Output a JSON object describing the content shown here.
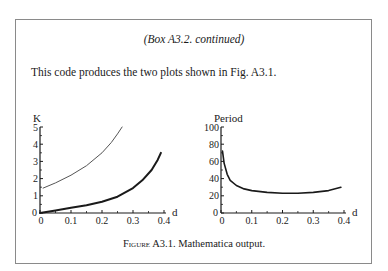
{
  "box": {
    "title": "(Box A3.2. continued)",
    "intro": "This code produces the two plots shown in Fig. A3.1."
  },
  "caption": {
    "label": "Figure A3.1.",
    "text": "Mathematica output."
  },
  "chart_data": [
    {
      "type": "line",
      "title": "",
      "ylabel": "K",
      "xlabel": "d",
      "xlim": [
        0,
        0.4
      ],
      "ylim": [
        0,
        5
      ],
      "xticks": [
        "0",
        "0.1",
        "0.2",
        "0.3",
        "0.4"
      ],
      "yticks": [
        "0",
        "1",
        "2",
        "3",
        "4",
        "5"
      ],
      "grid": false,
      "series": [
        {
          "name": "upper curve (thin)",
          "x": [
            0.01,
            0.05,
            0.1,
            0.15,
            0.2,
            0.23,
            0.25,
            0.265
          ],
          "y": [
            1.45,
            1.75,
            2.2,
            2.75,
            3.5,
            4.1,
            4.6,
            5.0
          ]
        },
        {
          "name": "lower curve (thick)",
          "x": [
            0.0,
            0.05,
            0.1,
            0.15,
            0.2,
            0.25,
            0.3,
            0.33,
            0.36,
            0.38,
            0.39
          ],
          "y": [
            0.0,
            0.15,
            0.3,
            0.45,
            0.65,
            0.95,
            1.45,
            1.9,
            2.5,
            3.1,
            3.5
          ]
        }
      ]
    },
    {
      "type": "line",
      "title": "",
      "ylabel": "Period",
      "xlabel": "d",
      "xlim": [
        0,
        0.4
      ],
      "ylim": [
        0,
        100
      ],
      "xticks": [
        "0",
        "0.1",
        "0.2",
        "0.3",
        "0.4"
      ],
      "yticks": [
        "0",
        "20",
        "40",
        "60",
        "80",
        "100"
      ],
      "grid": false,
      "series": [
        {
          "name": "period",
          "x": [
            0.005,
            0.01,
            0.02,
            0.03,
            0.05,
            0.075,
            0.1,
            0.15,
            0.2,
            0.25,
            0.3,
            0.35,
            0.39
          ],
          "y": [
            72,
            58,
            45,
            38,
            32,
            28,
            26,
            24,
            23,
            23,
            24,
            26,
            30
          ]
        }
      ]
    }
  ]
}
